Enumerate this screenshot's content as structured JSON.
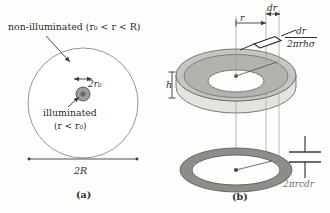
{
  "figure": {
    "background_color": "#fdfdfc",
    "ink_color": "#2b2b2b",
    "panels": [
      {
        "tag": "(a)",
        "name": "panel-a-top-view"
      },
      {
        "tag": "(b)",
        "name": "panel-b-perspective-view"
      }
    ]
  },
  "panel_a": {
    "tag": "(a)",
    "non_illuminated_label": "non-illuminated (r₀ < r < R)",
    "illuminated_label": "illuminated",
    "illuminated_condition": "(r < r₀)",
    "inner_diameter_label": "2r₀",
    "outer_diameter_label": "2R",
    "outer_circle": {
      "fill": "#ffffff",
      "stroke": "#7a7a7a"
    },
    "inner_disc": {
      "fill": "#9a9a9a",
      "stroke": "#555555"
    },
    "inner_core": {
      "fill": "#6f6f6f"
    }
  },
  "panel_b": {
    "tag": "(b)",
    "height_label": "h",
    "radius_label": "r",
    "differential_label": "dr",
    "resistance_numerator": "dr",
    "resistance_denominator": "2πrhσ",
    "capacitance_label": "2πrcdr",
    "cylinder": {
      "side_fill": "#e3e2de",
      "top_annulus_fill": "#b9b8b4",
      "hole_fill": "#ffffff",
      "stroke": "#6d6d6d"
    },
    "lower_ring": {
      "outer_fill": "#8d8d8a",
      "inner_fill": "#ffffff",
      "stroke": "#5e5e5e"
    },
    "resistor_symbol_name": "resistor-symbol",
    "capacitor_symbol_name": "capacitor-symbol"
  }
}
